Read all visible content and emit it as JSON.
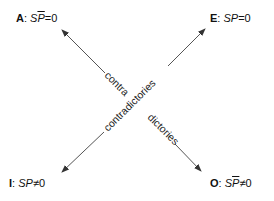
{
  "corners": {
    "A": {
      "letter": "A",
      "sep": ": ",
      "formula": "SP̅=0",
      "sp": "S",
      "p": "P",
      "op": "=0",
      "p_barred": true
    },
    "E": {
      "letter": "E",
      "sep": ": ",
      "formula": "SP=0",
      "sp": "S",
      "p": "P",
      "op": "=0",
      "p_barred": false
    },
    "I": {
      "letter": "I",
      "sep": ": ",
      "formula": "SP≠0",
      "sp": "S",
      "p": "P",
      "op": "≠0",
      "p_barred": false
    },
    "O": {
      "letter": "O",
      "sep": ": ",
      "formula": "SP̅≠0",
      "sp": "S",
      "p": "P",
      "op": "≠0",
      "p_barred": true
    }
  },
  "diagonals": {
    "a_to_o": {
      "label_part1": "contra",
      "label_part2": "dictories"
    },
    "e_to_i": {
      "label": "contradictories"
    }
  },
  "colors": {
    "arrow": "#555555",
    "text": "#111111"
  }
}
